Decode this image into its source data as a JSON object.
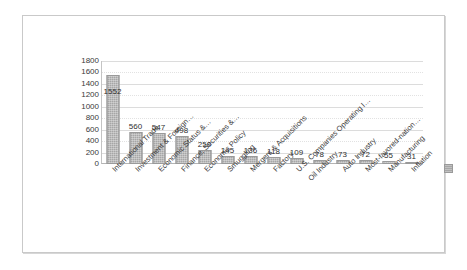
{
  "chart_data": {
    "type": "bar",
    "title": "",
    "subtitle": "",
    "xlabel": "",
    "ylabel": "",
    "ylim": [
      0,
      1800
    ],
    "yticks": [
      1800,
      1600,
      1400,
      1200,
      1000,
      800,
      600,
      400,
      200,
      0
    ],
    "grid": true,
    "legend_position": "right",
    "legend_entries": [
      ""
    ],
    "categories": [
      "International Trade",
      "Investment & Foreign…",
      "Economic Status &…",
      "Finance, Securities &…",
      "Economic Policy",
      "Smuggling",
      "Mergers & Acquisitions",
      "Factory",
      "U.S. Companies Operating I…",
      "Oil Industry",
      "Auto Industry",
      "Most-favored-nation…",
      "Manufacturing",
      "Inflation"
    ],
    "values": [
      1552,
      560,
      547,
      498,
      250,
      145,
      136,
      118,
      109,
      78,
      73,
      72,
      55,
      31
    ],
    "bar_labels": [
      "1552",
      "560",
      "547",
      "498",
      "250",
      "145",
      "136",
      "118",
      "109",
      "78",
      "73",
      "72",
      "55",
      "31"
    ],
    "series": [
      {
        "name": "",
        "values": [
          1552,
          560,
          547,
          498,
          250,
          145,
          136,
          118,
          109,
          78,
          73,
          72,
          55,
          31
        ]
      }
    ]
  },
  "colors": {
    "bar_fill": "#a6a6a6",
    "bar_border": "#9a9a9a",
    "gridline": "#dcdcdc",
    "axis": "#b4b4b4",
    "frame_border": "#c9c9c9",
    "text": "#3a3a3a",
    "plot_background": "#ffffff",
    "page_background": "#ffffff"
  }
}
